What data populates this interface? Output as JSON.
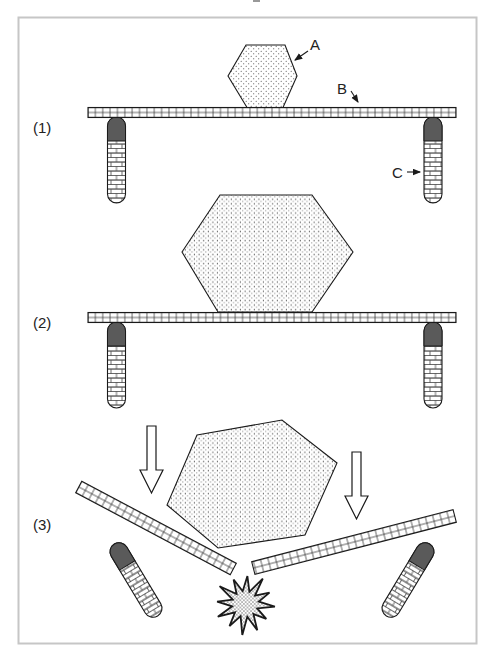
{
  "panels": [
    {
      "label": "(1)"
    },
    {
      "label": "(2)"
    },
    {
      "label": "(3)"
    }
  ],
  "annotations": {
    "rock": "A",
    "slab": "B",
    "column": "C"
  },
  "colors": {
    "background": "#ffffff",
    "frame_border": "#c6c6c6",
    "line": "#1a1a1a",
    "column_cap": "#5a5a5a"
  }
}
